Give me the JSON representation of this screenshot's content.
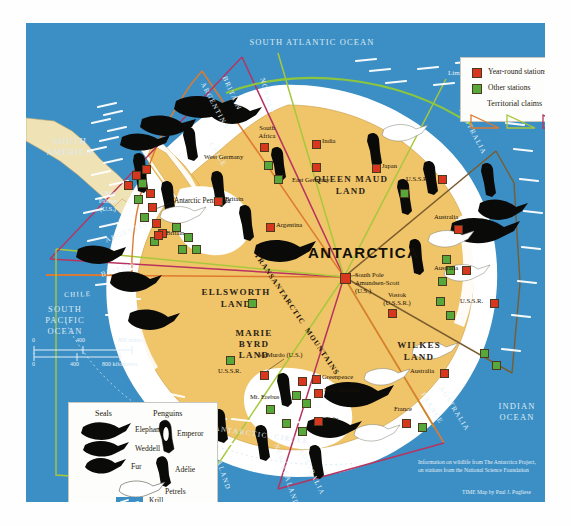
{
  "map": {
    "title": "ANTARCTICA",
    "oceans": [
      {
        "name": "SOUTH ATLANTIC OCEAN",
        "x": 196,
        "y": 14,
        "w": 180
      },
      {
        "name": "SOUTH\nAMERICA",
        "x": 14,
        "y": 113,
        "w": 60
      },
      {
        "name": "SOUTH\nPACIFIC\nOCEAN",
        "x": 8,
        "y": 281,
        "w": 62
      },
      {
        "name": "INDIAN\nOCEAN",
        "x": 462,
        "y": 378,
        "w": 58
      }
    ],
    "annotations": {
      "limit_undefined": "Limit Undefined",
      "antarctic_circle": "ANTARCTIC  CIRCLE",
      "transantarctic": "TRANSANTARCTIC  MOUNTAINS"
    },
    "land_labels": [
      {
        "text": "QUEEN MAUD\nLAND",
        "x": 277,
        "y": 150,
        "size": 9
      },
      {
        "text": "ELLSWORTH\nLAND",
        "x": 172,
        "y": 263,
        "size": 9
      },
      {
        "text": "MARIE\nBYRD\nLAND",
        "x": 213,
        "y": 308,
        "size": 9
      },
      {
        "text": "WILKES\nLAND",
        "x": 372,
        "y": 318,
        "size": 9
      },
      {
        "text": "Antarctic Peninsula",
        "x": 148,
        "y": 181,
        "size": 7.4
      }
    ],
    "stations": [
      {
        "label": "South\nAfrica",
        "x": 252,
        "y": 107,
        "type": "year-round"
      },
      {
        "label": "India",
        "x": 296,
        "y": 119,
        "type": "year-round"
      },
      {
        "label": "West Germany",
        "x": 206,
        "y": 132,
        "type": "other"
      },
      {
        "label": "East Germany",
        "x": 266,
        "y": 145,
        "type": "other"
      },
      {
        "label": "Japan",
        "x": 357,
        "y": 143,
        "type": "year-round"
      },
      {
        "label": "U.S.S.R.",
        "x": 387,
        "y": 156,
        "type": "year-round"
      },
      {
        "label": "Britain",
        "x": 200,
        "y": 175,
        "type": "year-round"
      },
      {
        "label": "Argentina",
        "x": 249,
        "y": 201,
        "type": "year-round"
      },
      {
        "label": "Australia",
        "x": 414,
        "y": 193,
        "type": "year-round"
      },
      {
        "label": "Australia",
        "x": 423,
        "y": 238,
        "type": "year-round"
      },
      {
        "label": "U.S.S.R.",
        "x": 434,
        "y": 273,
        "type": "year-round"
      },
      {
        "label": "Chile\nPalmer\n(U.S.)",
        "x": 44,
        "y": 166,
        "type": "year-round"
      },
      {
        "label": "Britain",
        "x": 141,
        "y": 211,
        "type": "year-round"
      },
      {
        "label": "South Pole\nAmundsen-Scott\n(U.S.)",
        "x": 315,
        "y": 258,
        "type": "year-round"
      },
      {
        "label": "Vostok\n(U.S.S.R.)",
        "x": 355,
        "y": 268,
        "type": "year-round"
      },
      {
        "label": "McMurdo (U.S.)",
        "x": 252,
        "y": 330,
        "type": "year-round"
      },
      {
        "label": "Greenpeace",
        "x": 322,
        "y": 353,
        "type": "year-round"
      },
      {
        "label": "New Zealand",
        "x": 330,
        "y": 365,
        "type": "year-round"
      },
      {
        "label": "Mt. Erebus",
        "x": 253,
        "y": 372,
        "type": "other"
      },
      {
        "label": "Italy",
        "x": 331,
        "y": 389,
        "type": "year-round"
      },
      {
        "label": "Australia",
        "x": 392,
        "y": 344,
        "type": "year-round"
      },
      {
        "label": "France",
        "x": 391,
        "y": 382,
        "type": "year-round"
      },
      {
        "label": "U.S.S.R.",
        "x": 210,
        "y": 344,
        "type": "other"
      }
    ],
    "claim_labels": [
      "ARGENTINA",
      "BRITAIN",
      "NORWAY",
      "AUSTRALIA",
      "CHILE",
      "ARGENTINA",
      "BRITAIN",
      "CHILE",
      "NEW ZEALAND",
      "NEW ZEALAND",
      "AUSTRALIA",
      "FRANCE",
      "AUSTRALIA"
    ],
    "scale": {
      "miles_ticks": [
        "0",
        "400",
        "800 miles"
      ],
      "km_ticks": [
        "0",
        "400",
        "800 kilometers"
      ]
    },
    "credits": {
      "source": "Information on wildlife from The Antarctica Project,\non stations from the National Science Foundation",
      "byline": "TIME Map by Paul J. Pugliese"
    }
  },
  "legend_top": {
    "items": [
      {
        "label": "Year-round stations",
        "swatch": "#d8361f",
        "icon": "red-square-icon"
      },
      {
        "label": "Other stations",
        "swatch": "#57a83b",
        "icon": "green-square-icon"
      }
    ],
    "claims_title": "Territorial claims",
    "claim_colors": [
      "#e07a2f",
      "#a8c83c",
      "#b8335f"
    ]
  },
  "legend_bottom": {
    "seals_title": "Seals",
    "penguins_title": "Penguins",
    "seals": [
      "Elephant",
      "Weddell",
      "Fur"
    ],
    "penguins": [
      "Emperor",
      "Adélie"
    ],
    "petrels": "Petrels",
    "krill": "Krill\nconcentrations"
  },
  "colors": {
    "ocean": "#3b8fc4",
    "ice": "#ffffff",
    "land": "#f0c468",
    "year_round": "#d8361f",
    "other": "#57a83b",
    "claim_orange": "#e07a2f",
    "claim_green": "#a8c83c",
    "claim_magenta": "#b8335f"
  }
}
